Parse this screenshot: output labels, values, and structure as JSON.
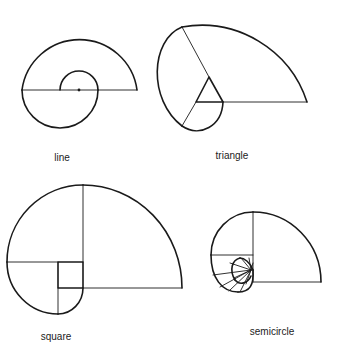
{
  "figures": [
    {
      "id": "line",
      "label": "line",
      "label_pos": {
        "x": 62,
        "y": 152
      },
      "thick_paths": [
        "M 22 90 A 58 58 0 0 1 137 90",
        "M 22 90 A 38 38 0 0 0 98 90",
        "M 98 90 A 19 19 0 0 0 60 90"
      ],
      "thin_paths": [
        "M 22 90 L 137 90"
      ],
      "dot": {
        "x": 79,
        "y": 90
      }
    },
    {
      "id": "triangle",
      "label": "triangle",
      "label_pos": {
        "x": 232,
        "y": 150
      },
      "thick_paths": [
        "M 307 102 A 111 111 0 0 0 182 27",
        "M 182 27 C 150 40 148 100 182 126",
        "M 182 126 C 200 138 222 126 223 102",
        "M 209 77 L 196 102 L 223 102 Z"
      ],
      "thin_paths": [
        "M 223 102 L 307 102",
        "M 209 77 L 182 27",
        "M 196 102 L 182 126"
      ],
      "dot": null
    },
    {
      "id": "square",
      "label": "square",
      "label_pos": {
        "x": 56,
        "y": 331
      },
      "thick_paths": [
        "M 182 288 A 99 103 0 0 0 83 185",
        "M 83 185 A 76 77 0 0 0 7 262",
        "M 7 262 A 51 52 0 0 0 58 314",
        "M 58 314 A 25 26 0 0 0 83 288",
        "M 58 262 L 83 262 L 83 288 L 58 288 Z"
      ],
      "thin_paths": [
        "M 83 185 L 83 262",
        "M 7 262 L 58 262",
        "M 83 288 L 182 288",
        "M 58 288 L 58 314"
      ],
      "dot": null
    },
    {
      "id": "semicircle",
      "label": "semicircle",
      "label_pos": {
        "x": 272,
        "y": 326
      },
      "thick_paths": [
        "M 321 282 A 68 70 0 0 0 253 212",
        "M 253 212 A 42 43 0 0 0 211 255",
        "M 211 255 C 211 278 222 292 238 292",
        "M 238 292 C 250 292 254 285 253 270",
        "M 253 270 C 250 262 244 258 240 258",
        "M 240 258 C 232 260 229 270 235 280",
        "M 235 280 C 240 286 248 283 251 276"
      ],
      "thin_paths": [
        "M 253 212 L 253 282",
        "M 253 282 L 321 282",
        "M 211 255 L 253 255",
        "M 251 270 L 213 275",
        "M 251 270 L 220 287",
        "M 251 270 L 229 291",
        "M 251 270 L 240 292",
        "M 251 270 L 230 263",
        "M 251 270 L 241 258",
        "M 251 270 L 249 258",
        "M 251 270 L 234 278",
        "M 251 270 L 246 284",
        "M 251 270 L 253 263"
      ],
      "dot": null
    }
  ]
}
